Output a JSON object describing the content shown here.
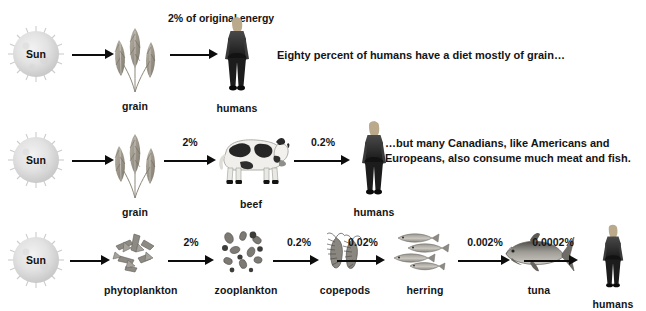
{
  "diagram": {
    "background_color": "#ffffff",
    "text_color": "#141414",
    "top_cut_text": "",
    "rows": [
      {
        "id": "grain-chain",
        "nodes": [
          {
            "key": "sun",
            "label": "Sun",
            "icon": "sun-icon"
          },
          {
            "key": "grain",
            "label": "grain",
            "icon": "wheat-grain-icon"
          },
          {
            "key": "humans",
            "label": "humans",
            "icon": "human-figure-icon"
          }
        ],
        "arrows": [
          {
            "from": "sun",
            "to": "grain",
            "label": ""
          },
          {
            "from": "grain",
            "to": "humans",
            "label": "2% of original energy"
          }
        ],
        "caption": "Eighty percent of humans have a diet mostly of grain…"
      },
      {
        "id": "beef-chain",
        "nodes": [
          {
            "key": "sun",
            "label": "Sun",
            "icon": "sun-icon"
          },
          {
            "key": "grain",
            "label": "grain",
            "icon": "wheat-grain-icon"
          },
          {
            "key": "beef",
            "label": "beef",
            "icon": "cow-icon"
          },
          {
            "key": "humans",
            "label": "humans",
            "icon": "human-figure-icon"
          }
        ],
        "arrows": [
          {
            "from": "sun",
            "to": "grain",
            "label": ""
          },
          {
            "from": "grain",
            "to": "beef",
            "label": "2%"
          },
          {
            "from": "beef",
            "to": "humans",
            "label": "0.2%"
          }
        ],
        "caption": "…but many Canadians, like Americans and Europeans, also consume much meat and fish."
      },
      {
        "id": "marine-chain",
        "nodes": [
          {
            "key": "sun",
            "label": "Sun",
            "icon": "sun-icon"
          },
          {
            "key": "phytoplankton",
            "label": "phytoplankton",
            "icon": "phytoplankton-icon"
          },
          {
            "key": "zooplankton",
            "label": "zooplankton",
            "icon": "zooplankton-icon"
          },
          {
            "key": "copepods",
            "label": "copepods",
            "icon": "copepod-icon"
          },
          {
            "key": "herring",
            "label": "herring",
            "icon": "herring-school-icon"
          },
          {
            "key": "tuna",
            "label": "tuna",
            "icon": "tuna-icon"
          },
          {
            "key": "humans",
            "label": "humans",
            "icon": "human-figure-icon"
          }
        ],
        "arrows": [
          {
            "from": "sun",
            "to": "phytoplankton",
            "label": ""
          },
          {
            "from": "phytoplankton",
            "to": "zooplankton",
            "label": "2%"
          },
          {
            "from": "zooplankton",
            "to": "copepods",
            "label": "0.2%"
          },
          {
            "from": "copepods",
            "to": "herring",
            "label": "0.02%"
          },
          {
            "from": "herring",
            "to": "tuna",
            "label": "0.002%"
          },
          {
            "from": "tuna",
            "to": "humans",
            "label": "0.0002%"
          }
        ],
        "caption": ""
      }
    ],
    "energy_data": {
      "type": "table",
      "title": "Percent of original solar energy remaining at each trophic level",
      "chains": [
        {
          "name": "grain chain",
          "steps": [
            "Sun",
            "grain",
            "humans"
          ],
          "percents": [
            100,
            null,
            2
          ]
        },
        {
          "name": "beef chain",
          "steps": [
            "Sun",
            "grain",
            "beef",
            "humans"
          ],
          "percents": [
            100,
            null,
            2,
            0.2
          ]
        },
        {
          "name": "marine chain",
          "steps": [
            "Sun",
            "phytoplankton",
            "zooplankton",
            "copepods",
            "herring",
            "tuna",
            "humans"
          ],
          "percents": [
            100,
            null,
            2,
            0.2,
            0.02,
            0.002,
            0.0002
          ]
        }
      ]
    }
  }
}
